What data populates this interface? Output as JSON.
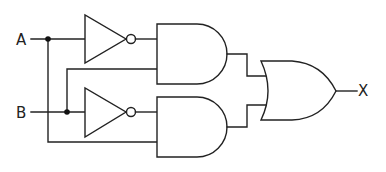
{
  "diagram": {
    "type": "logic-circuit",
    "inputs": [
      {
        "label": "A"
      },
      {
        "label": "B"
      }
    ],
    "output": {
      "label": "X"
    },
    "gates": [
      {
        "id": "not-a",
        "type": "NOT",
        "input": "A"
      },
      {
        "id": "not-b",
        "type": "NOT",
        "input": "B"
      },
      {
        "id": "and-top",
        "type": "AND",
        "inputs": [
          "NOT A",
          "B"
        ]
      },
      {
        "id": "and-bottom",
        "type": "AND",
        "inputs": [
          "NOT B",
          "A"
        ]
      },
      {
        "id": "or-out",
        "type": "OR",
        "inputs": [
          "and-top",
          "and-bottom"
        ],
        "output": "X"
      }
    ],
    "colors": {
      "line": "#222222",
      "background": "#ffffff"
    }
  }
}
